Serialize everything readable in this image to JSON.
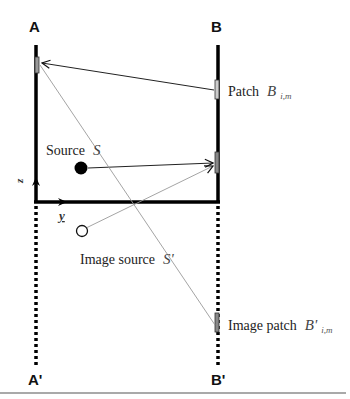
{
  "diagram": {
    "walls": {
      "left_label": "A",
      "right_label": "B",
      "left_image_label": "A'",
      "right_image_label": "B'"
    },
    "axes": {
      "z_label": "z",
      "y_label": "y"
    },
    "source": {
      "label_text": "Source",
      "symbol": "S"
    },
    "image_source": {
      "label_text": "Image source",
      "symbol": "S'"
    },
    "patch": {
      "label_text": "Patch",
      "symbol": "B",
      "subscript": "i,m"
    },
    "image_patch": {
      "label_text": "Image patch",
      "symbol": "B'",
      "subscript": "i,m"
    },
    "colors": {
      "wall": "#000000",
      "ray": "#222222",
      "image_ray": "#9a9a9a",
      "patch_fill": "#888888",
      "rule": "#555555"
    }
  }
}
